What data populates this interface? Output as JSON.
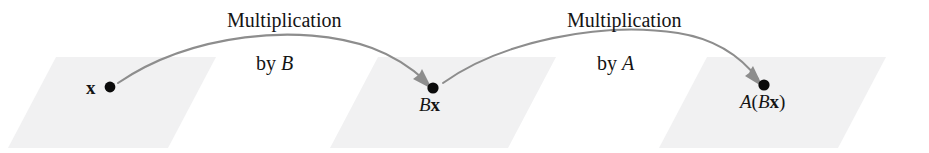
{
  "figure": {
    "type": "composition-of-linear-transformations-diagram",
    "background_color": "#ffffff",
    "plane_color": "#f1f1f2",
    "arrow_color": "#8d8d8d",
    "dot_color": "#0b0b0b",
    "text_color": "#141414"
  },
  "points": [
    {
      "id": "x",
      "label_plain": "x",
      "label_parts": [
        {
          "text": "x",
          "style": "bold"
        }
      ],
      "dot": {
        "cx": 110,
        "cy": 87,
        "r": 5.4
      },
      "label_position": "left-of-dot"
    },
    {
      "id": "Bx",
      "label_plain": "Bx",
      "label_parts": [
        {
          "text": "B",
          "style": "italic"
        },
        {
          "text": "x",
          "style": "bold"
        }
      ],
      "dot": {
        "cx": 433,
        "cy": 88,
        "r": 5.6
      },
      "label_position": "below-dot"
    },
    {
      "id": "A(Bx)",
      "label_plain": "A(Bx)",
      "label_parts": [
        {
          "text": "A",
          "style": "italic"
        },
        {
          "text": "(",
          "style": "roman"
        },
        {
          "text": "B",
          "style": "italic"
        },
        {
          "text": "x",
          "style": "bold"
        },
        {
          "text": ")",
          "style": "roman"
        }
      ],
      "dot": {
        "cx": 764,
        "cy": 85,
        "r": 5.6
      },
      "label_position": "below-dot"
    }
  ],
  "arrows": [
    {
      "id": "arrow-b",
      "from": "x",
      "to": "Bx",
      "line1": "Multiplication",
      "line2_prefix": "by ",
      "line2_symbol": "B",
      "label_plain": "Multiplication by B"
    },
    {
      "id": "arrow-a",
      "from": "Bx",
      "to": "A(Bx)",
      "line1": "Multiplication",
      "line2_prefix": "by ",
      "line2_symbol": "A",
      "label_plain": "Multiplication by A"
    }
  ],
  "planes": [
    {
      "id": "plane-domain",
      "top_left_x": 56,
      "top_right_x": 216,
      "bottom_left_x": 8,
      "bottom_right_x": 168,
      "top_y": 57,
      "bottom_y": 148
    },
    {
      "id": "plane-intermediate",
      "top_left_x": 378,
      "top_right_x": 556,
      "bottom_left_x": 330,
      "bottom_right_x": 508,
      "top_y": 57,
      "bottom_y": 148
    },
    {
      "id": "plane-codomain",
      "top_left_x": 707,
      "top_right_x": 886,
      "bottom_left_x": 659,
      "bottom_right_x": 838,
      "top_y": 57,
      "bottom_y": 148
    }
  ]
}
